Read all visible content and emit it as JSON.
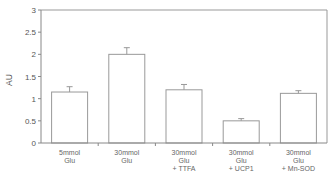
{
  "chart_data": {
    "type": "bar",
    "title": "",
    "xlabel": "",
    "ylabel": "AU",
    "ylim": [
      0,
      3
    ],
    "yticks": [
      "0",
      "0.5",
      "1",
      "1.5",
      "2",
      "2.5",
      "3"
    ],
    "grid": false,
    "legend": null,
    "categories": [
      [
        "5mmol",
        "Glu"
      ],
      [
        "30mmol",
        "Glu"
      ],
      [
        "30mmol",
        "Glu",
        "+ TTFA"
      ],
      [
        "30mmol",
        "Glu",
        "+ UCP1"
      ],
      [
        "30mmol",
        "Glu",
        "+ Mn-SOD"
      ]
    ],
    "values": [
      1.15,
      2.0,
      1.2,
      0.5,
      1.12
    ],
    "error_upper": [
      0.12,
      0.15,
      0.12,
      0.05,
      0.06
    ],
    "colors": {
      "axis": "#888888",
      "bar_fill": "#ffffff",
      "bar_stroke": "#999999",
      "frame": "#999999"
    }
  }
}
